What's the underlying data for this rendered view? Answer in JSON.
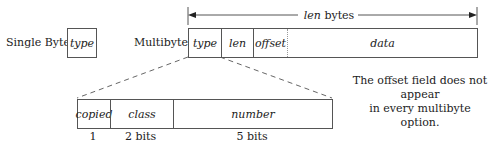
{
  "single_byte": {
    "label": "Single Byte:",
    "fields": [
      "type"
    ]
  },
  "multibyte": {
    "label": "Multibyte:",
    "length_label_italic": "len",
    "length_label_rest": " bytes",
    "fields": [
      "type",
      "len",
      "offset",
      "data"
    ]
  },
  "type_breakdown": {
    "fields": [
      "copied",
      "class",
      "number"
    ],
    "sizes": [
      "1",
      "2 bits",
      "5 bits"
    ]
  },
  "note": {
    "line1": "The offset field does not appear",
    "line2": "in every multibyte option."
  }
}
